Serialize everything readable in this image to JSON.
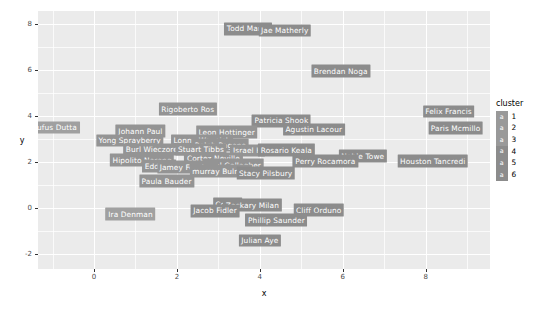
{
  "chart_data": {
    "type": "scatter",
    "title": "",
    "xlabel": "x",
    "ylabel": "y",
    "xlim": [
      -1.35,
      9.55
    ],
    "ylim": [
      -2.65,
      8.55
    ],
    "xticks": [
      "0",
      "2",
      "4",
      "6",
      "8"
    ],
    "xtick_values": [
      0,
      2,
      4,
      6,
      8
    ],
    "yticks": [
      "8",
      "6",
      "4",
      "2",
      "0",
      "-2"
    ],
    "ytick_values": [
      8,
      6,
      4,
      2,
      0,
      -2
    ],
    "grid": true,
    "legend_position": "right",
    "legend_title": "cluster",
    "legend_glyph": "a",
    "legend_entries": [
      {
        "label": "1",
        "color": "#999999"
      },
      {
        "label": "2",
        "color": "#999999"
      },
      {
        "label": "3",
        "color": "#999999"
      },
      {
        "label": "4",
        "color": "#8c8c8c"
      },
      {
        "label": "5",
        "color": "#8c8c8c"
      },
      {
        "label": "6",
        "color": "#8c8c8c"
      }
    ],
    "points": [
      {
        "label": "Todd Mangi",
        "x": 3.72,
        "y": 7.78,
        "cluster": 3,
        "color": "#8c8c8c"
      },
      {
        "label": "Jae Matherly",
        "x": 4.6,
        "y": 7.7,
        "cluster": 3,
        "color": "#8c8c8c"
      },
      {
        "label": "Brendan Noga",
        "x": 5.95,
        "y": 5.93,
        "cluster": 3,
        "color": "#8c8c8c"
      },
      {
        "label": "Rigoberto Ros",
        "x": 2.26,
        "y": 4.29,
        "cluster": 2,
        "color": "#949494"
      },
      {
        "label": "Felix Francis",
        "x": 8.55,
        "y": 4.18,
        "cluster": 5,
        "color": "#8c8c8c"
      },
      {
        "label": "Patricia Shook",
        "x": 4.52,
        "y": 3.78,
        "cluster": 3,
        "color": "#8c8c8c"
      },
      {
        "label": "Agustin Lacour",
        "x": 5.3,
        "y": 3.4,
        "cluster": 3,
        "color": "#8c8c8c"
      },
      {
        "label": "Paris Mcmillo",
        "x": 8.72,
        "y": 3.46,
        "cluster": 5,
        "color": "#8c8c8c"
      },
      {
        "label": "Rufus Dutta",
        "x": -0.95,
        "y": 3.49,
        "cluster": 1,
        "color": "#a0a0a0"
      },
      {
        "label": "Johann Paul",
        "x": 1.12,
        "y": 3.32,
        "cluster": 2,
        "color": "#949494"
      },
      {
        "label": "Leon Hottinger",
        "x": 3.2,
        "y": 3.3,
        "cluster": 2,
        "color": "#949494"
      },
      {
        "label": "Yong Sprayberry",
        "x": 0.86,
        "y": 2.92,
        "cluster": 2,
        "color": "#949494"
      },
      {
        "label": "Lonny Waynick",
        "x": 2.6,
        "y": 2.92,
        "cluster": 2,
        "color": "#949494"
      },
      {
        "label": "Ralph Pagano",
        "x": 3.05,
        "y": 2.72,
        "cluster": 2,
        "color": "#949494"
      },
      {
        "label": "Burl Wieczorek",
        "x": 1.45,
        "y": 2.53,
        "cluster": 2,
        "color": "#949494"
      },
      {
        "label": "Stuart Tibbs",
        "x": 2.58,
        "y": 2.53,
        "cluster": 2,
        "color": "#949494"
      },
      {
        "label": "Israel H",
        "x": 3.7,
        "y": 2.49,
        "cluster": 2,
        "color": "#949494"
      },
      {
        "label": "Rosario Keala",
        "x": 4.64,
        "y": 2.51,
        "cluster": 4,
        "color": "#8c8c8c"
      },
      {
        "label": "Hipolito Narang",
        "x": 1.16,
        "y": 2.08,
        "cluster": 2,
        "color": "#949494"
      },
      {
        "label": "Cortez Neville",
        "x": 2.88,
        "y": 2.14,
        "cluster": 2,
        "color": "#949494"
      },
      {
        "label": "Noble Towe",
        "x": 6.48,
        "y": 2.24,
        "cluster": 4,
        "color": "#8c8c8c"
      },
      {
        "label": "Perry Rocamora",
        "x": 5.58,
        "y": 2.02,
        "cluster": 4,
        "color": "#8c8c8c"
      },
      {
        "label": "Houston Tancredi",
        "x": 8.17,
        "y": 2.02,
        "cluster": 6,
        "color": "#8c8c8c"
      },
      {
        "label": "neal Gallagher",
        "x": 3.36,
        "y": 1.86,
        "cluster": 2,
        "color": "#949494"
      },
      {
        "label": "Eddie A",
        "x": 1.57,
        "y": 1.8,
        "cluster": 2,
        "color": "#949494"
      },
      {
        "label": "Jamey Ferebee",
        "x": 2.26,
        "y": 1.78,
        "cluster": 2,
        "color": "#949494"
      },
      {
        "label": "murray Bulmer",
        "x": 3.06,
        "y": 1.6,
        "cluster": 2,
        "color": "#949494"
      },
      {
        "label": "Stacy Pilsbury",
        "x": 4.14,
        "y": 1.52,
        "cluster": 4,
        "color": "#8c8c8c"
      },
      {
        "label": "Paula Bauder",
        "x": 1.75,
        "y": 1.17,
        "cluster": 2,
        "color": "#949494"
      },
      {
        "label": "Cornel",
        "x": 3.22,
        "y": 0.16,
        "cluster": 4,
        "color": "#8c8c8c"
      },
      {
        "label": "Zackary Milan",
        "x": 3.82,
        "y": 0.12,
        "cluster": 4,
        "color": "#8c8c8c"
      },
      {
        "label": "Jacob Fidler",
        "x": 2.92,
        "y": -0.12,
        "cluster": 4,
        "color": "#8c8c8c"
      },
      {
        "label": "Cliff Orduno",
        "x": 5.42,
        "y": -0.1,
        "cluster": 4,
        "color": "#8c8c8c"
      },
      {
        "label": "Ira Denman",
        "x": 0.88,
        "y": -0.26,
        "cluster": 1,
        "color": "#a0a0a0"
      },
      {
        "label": "Phillip Saunder",
        "x": 4.4,
        "y": -0.52,
        "cluster": 4,
        "color": "#8c8c8c"
      },
      {
        "label": "Julian Aye",
        "x": 4.0,
        "y": -1.42,
        "cluster": 4,
        "color": "#8c8c8c"
      }
    ]
  }
}
